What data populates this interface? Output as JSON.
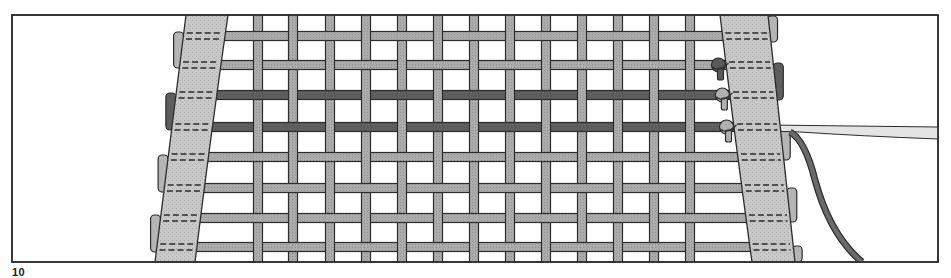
{
  "figure": {
    "caption_visible_start": "10",
    "frame": {
      "x": 12,
      "y": 15,
      "width": 926,
      "height": 247
    },
    "colors": {
      "background": "#ffffff",
      "outline": "#2b2b2b",
      "rail_fill": "#c4c4c4",
      "strand_light": "#a8a8a8",
      "strand_dark": "#5e5e5e",
      "knot_light": "#b0b0b0",
      "knot_dark": "#5a5a5a",
      "stitch": "#2b2b2b",
      "loose_strand_fill": "#e2e2e2"
    },
    "left_rail": {
      "top_left": 186,
      "top_right": 228,
      "bottom_left": 155,
      "bottom_right": 195
    },
    "right_rail": {
      "top_left": 720,
      "top_right": 768,
      "bottom_left": 752,
      "bottom_right": 795
    },
    "vertical_strands_x": [
      258,
      293,
      330,
      366,
      402,
      438,
      474,
      510,
      546,
      582,
      618,
      654,
      690
    ],
    "horizontal_strands": [
      {
        "y": 36,
        "tone": "light"
      },
      {
        "y": 65,
        "tone": "light"
      },
      {
        "y": 95,
        "tone": "dark"
      },
      {
        "y": 127,
        "tone": "dark"
      },
      {
        "y": 157,
        "tone": "light"
      },
      {
        "y": 188,
        "tone": "light"
      },
      {
        "y": 218,
        "tone": "light"
      },
      {
        "y": 247,
        "tone": "light"
      }
    ],
    "knots": [
      {
        "y": 65,
        "tone": "dark"
      },
      {
        "y": 95,
        "tone": "light"
      },
      {
        "y": 127,
        "tone": "light"
      }
    ],
    "left_tabs": [
      {
        "y1": 32,
        "y2": 68,
        "tone": "light"
      },
      {
        "y1": 93,
        "y2": 130,
        "tone": "dark"
      },
      {
        "y1": 155,
        "y2": 192,
        "tone": "light"
      },
      {
        "y1": 215,
        "y2": 252,
        "tone": "light"
      }
    ],
    "right_tabs": [
      {
        "y1": 16,
        "y2": 42,
        "tone": "light"
      },
      {
        "y1": 63,
        "y2": 100,
        "tone": "dark"
      },
      {
        "y1": 130,
        "y2": 160,
        "tone": "light"
      },
      {
        "y1": 188,
        "y2": 222,
        "tone": "light"
      },
      {
        "y1": 246,
        "y2": 262,
        "tone": "light"
      }
    ]
  }
}
